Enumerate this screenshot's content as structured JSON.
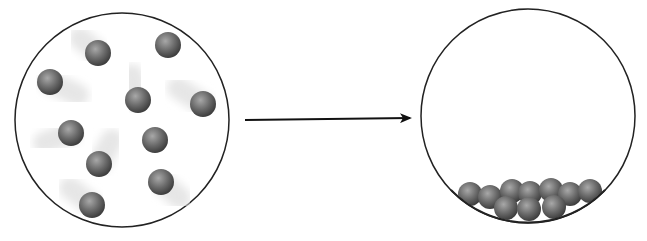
{
  "diagram": {
    "colors": {
      "outline": "#222222",
      "particle": "#6e6e6e",
      "trail": "#e6e6e6",
      "arrow": "#111111"
    },
    "left_container": {
      "label": "gas",
      "cx": 122,
      "cy": 120,
      "r": 107,
      "particles": [
        {
          "x": 98,
          "y": 53,
          "tx": 80,
          "ty": 38
        },
        {
          "x": 168,
          "y": 45,
          "tx": 140,
          "ty": 45
        },
        {
          "x": 50,
          "y": 82,
          "tx": 78,
          "ty": 95
        },
        {
          "x": 138,
          "y": 100,
          "tx": 132,
          "ty": 75
        },
        {
          "x": 203,
          "y": 104,
          "tx": 178,
          "ty": 88
        },
        {
          "x": 71,
          "y": 133,
          "tx": 44,
          "ty": 143
        },
        {
          "x": 155,
          "y": 140,
          "tx": 182,
          "ty": 140
        },
        {
          "x": 99,
          "y": 164,
          "tx": 112,
          "ty": 140
        },
        {
          "x": 161,
          "y": 182,
          "tx": 180,
          "ty": 198
        },
        {
          "x": 92,
          "y": 205,
          "tx": 70,
          "ty": 188
        }
      ]
    },
    "arrow": {
      "x1": 245,
      "y1": 120,
      "x2": 410,
      "y2": 118
    },
    "right_container": {
      "label": "liquid",
      "cx": 528,
      "cy": 116,
      "r": 107,
      "particles": [
        {
          "x": 470,
          "y": 194
        },
        {
          "x": 490,
          "y": 197
        },
        {
          "x": 512,
          "y": 191
        },
        {
          "x": 530,
          "y": 193
        },
        {
          "x": 551,
          "y": 190
        },
        {
          "x": 570,
          "y": 194
        },
        {
          "x": 590,
          "y": 191
        },
        {
          "x": 506,
          "y": 208
        },
        {
          "x": 529,
          "y": 209
        },
        {
          "x": 554,
          "y": 207
        }
      ]
    }
  }
}
